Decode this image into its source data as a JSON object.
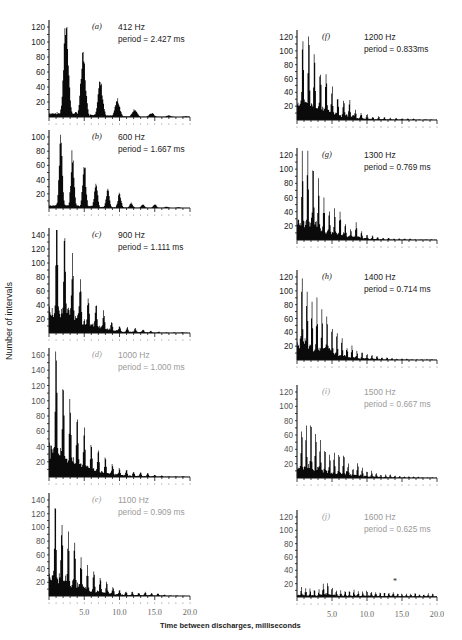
{
  "figure": {
    "ylabel": "Number of intervals",
    "xlabel": "Time between discharges, milliseconds",
    "xticks": [
      "5.0",
      "10.0",
      "15.0",
      "20.0"
    ]
  },
  "chart_data": [
    {
      "type": "bar",
      "panel": "(a)",
      "title": "412 Hz",
      "subtitle": "period = 2.427 ms",
      "xlabel": "Time between discharges, milliseconds",
      "ylabel": "Number of intervals",
      "xlim": [
        0,
        20
      ],
      "ylim": [
        0,
        120
      ],
      "yticks": [
        20,
        40,
        60,
        80,
        100,
        120
      ],
      "period_ms": 2.427,
      "peaks": [
        {
          "x": 2.43,
          "y": 122
        },
        {
          "x": 4.85,
          "y": 78
        },
        {
          "x": 7.28,
          "y": 45
        },
        {
          "x": 9.71,
          "y": 22
        },
        {
          "x": 12.14,
          "y": 10
        },
        {
          "x": 14.56,
          "y": 5
        },
        {
          "x": 16.99,
          "y": 2
        },
        {
          "x": 19.42,
          "y": 1
        }
      ],
      "column": "left",
      "box": {
        "top": 20,
        "base": 117
      }
    },
    {
      "type": "bar",
      "panel": "(b)",
      "title": "600 Hz",
      "subtitle": "period = 1.667 ms",
      "xlim": [
        0,
        20
      ],
      "ylim": [
        0,
        100
      ],
      "yticks": [
        20,
        40,
        60,
        80,
        100
      ],
      "period_ms": 1.667,
      "peaks": [
        {
          "x": 1.67,
          "y": 95
        },
        {
          "x": 3.33,
          "y": 75
        },
        {
          "x": 5.0,
          "y": 62
        },
        {
          "x": 6.67,
          "y": 37
        },
        {
          "x": 8.33,
          "y": 25
        },
        {
          "x": 10.0,
          "y": 20
        },
        {
          "x": 11.67,
          "y": 7
        },
        {
          "x": 13.33,
          "y": 5
        },
        {
          "x": 15.0,
          "y": 5
        },
        {
          "x": 16.67,
          "y": 2
        },
        {
          "x": 18.33,
          "y": 1
        }
      ],
      "column": "left",
      "box": {
        "top": 130,
        "base": 208
      }
    },
    {
      "type": "bar",
      "panel": "(c)",
      "title": "900 Hz",
      "subtitle": "period = 1.111 ms",
      "xlim": [
        0,
        20
      ],
      "ylim": [
        0,
        140
      ],
      "yticks": [
        20,
        40,
        60,
        80,
        100,
        120,
        140
      ],
      "period_ms": 1.111,
      "peaks": [
        {
          "x": 1.11,
          "y": 145
        },
        {
          "x": 2.22,
          "y": 145
        },
        {
          "x": 3.33,
          "y": 102
        },
        {
          "x": 4.44,
          "y": 75
        },
        {
          "x": 5.56,
          "y": 55
        },
        {
          "x": 6.67,
          "y": 42
        },
        {
          "x": 7.78,
          "y": 30
        },
        {
          "x": 8.89,
          "y": 17
        },
        {
          "x": 10.0,
          "y": 10
        },
        {
          "x": 11.11,
          "y": 8
        },
        {
          "x": 12.22,
          "y": 7
        },
        {
          "x": 13.33,
          "y": 5
        },
        {
          "x": 14.44,
          "y": 3
        },
        {
          "x": 15.56,
          "y": 2
        },
        {
          "x": 16.67,
          "y": 1
        },
        {
          "x": 17.78,
          "y": 1
        },
        {
          "x": 18.89,
          "y": 1
        }
      ],
      "column": "left",
      "box": {
        "top": 228,
        "base": 333
      }
    },
    {
      "type": "bar",
      "panel": "(d)",
      "title": "1000 Hz",
      "subtitle": "period = 1.000 ms",
      "xlim": [
        0,
        20
      ],
      "ylim": [
        0,
        180
      ],
      "yticks": [
        20,
        40,
        60,
        80,
        100,
        120,
        140,
        160
      ],
      "period_ms": 1.0,
      "peaks": [
        {
          "x": 1,
          "y": 175
        },
        {
          "x": 2,
          "y": 125
        },
        {
          "x": 3,
          "y": 100
        },
        {
          "x": 4,
          "y": 83
        },
        {
          "x": 5,
          "y": 62
        },
        {
          "x": 6,
          "y": 47
        },
        {
          "x": 7,
          "y": 33
        },
        {
          "x": 8,
          "y": 27
        },
        {
          "x": 9,
          "y": 17
        },
        {
          "x": 10,
          "y": 11
        },
        {
          "x": 11,
          "y": 9
        },
        {
          "x": 12,
          "y": 7
        },
        {
          "x": 13,
          "y": 6
        },
        {
          "x": 14,
          "y": 5
        },
        {
          "x": 15,
          "y": 3
        },
        {
          "x": 16,
          "y": 2
        },
        {
          "x": 17,
          "y": 1
        },
        {
          "x": 18,
          "y": 1
        },
        {
          "x": 19,
          "y": 1
        }
      ],
      "column": "left",
      "box": {
        "top": 348,
        "base": 477
      }
    },
    {
      "type": "bar",
      "panel": "(e)",
      "title": "1100 Hz",
      "subtitle": "period = 0.909 ms",
      "xlim": [
        0,
        20
      ],
      "ylim": [
        0,
        140
      ],
      "yticks": [
        20,
        40,
        60,
        80,
        100,
        120,
        140
      ],
      "period_ms": 0.909,
      "peaks": [
        {
          "x": 0.91,
          "y": 135
        },
        {
          "x": 1.82,
          "y": 120
        },
        {
          "x": 2.73,
          "y": 90
        },
        {
          "x": 3.64,
          "y": 86
        },
        {
          "x": 4.55,
          "y": 55
        },
        {
          "x": 5.45,
          "y": 40
        },
        {
          "x": 6.36,
          "y": 40
        },
        {
          "x": 7.27,
          "y": 28
        },
        {
          "x": 8.18,
          "y": 22
        },
        {
          "x": 9.09,
          "y": 14
        },
        {
          "x": 10.0,
          "y": 9
        },
        {
          "x": 10.91,
          "y": 7
        },
        {
          "x": 11.82,
          "y": 6
        },
        {
          "x": 12.73,
          "y": 5
        },
        {
          "x": 13.64,
          "y": 6
        },
        {
          "x": 14.55,
          "y": 4
        },
        {
          "x": 15.45,
          "y": 4
        },
        {
          "x": 16.36,
          "y": 2
        },
        {
          "x": 17.27,
          "y": 1
        },
        {
          "x": 18.18,
          "y": 1
        }
      ],
      "column": "left",
      "box": {
        "top": 493,
        "base": 596
      }
    },
    {
      "type": "bar",
      "panel": "(f)",
      "title": "1200 Hz",
      "subtitle": "period = 0.833ms",
      "xlim": [
        0,
        20
      ],
      "ylim": [
        0,
        120
      ],
      "yticks": [
        20,
        40,
        60,
        80,
        100,
        120
      ],
      "period_ms": 0.833,
      "peaks": [
        {
          "x": 0.83,
          "y": 122
        },
        {
          "x": 1.67,
          "y": 122
        },
        {
          "x": 2.5,
          "y": 98
        },
        {
          "x": 3.33,
          "y": 77
        },
        {
          "x": 4.17,
          "y": 71
        },
        {
          "x": 5.0,
          "y": 47
        },
        {
          "x": 5.83,
          "y": 33
        },
        {
          "x": 6.67,
          "y": 33
        },
        {
          "x": 7.5,
          "y": 28
        },
        {
          "x": 8.33,
          "y": 14
        },
        {
          "x": 9.17,
          "y": 10
        },
        {
          "x": 10.0,
          "y": 8
        },
        {
          "x": 10.83,
          "y": 5
        },
        {
          "x": 11.67,
          "y": 5
        },
        {
          "x": 12.5,
          "y": 4
        },
        {
          "x": 13.33,
          "y": 3
        },
        {
          "x": 14.17,
          "y": 3
        },
        {
          "x": 15.0,
          "y": 2
        },
        {
          "x": 15.83,
          "y": 2
        },
        {
          "x": 16.67,
          "y": 2
        },
        {
          "x": 17.5,
          "y": 1
        },
        {
          "x": 18.33,
          "y": 1
        },
        {
          "x": 19.17,
          "y": 1
        }
      ],
      "column": "right",
      "box": {
        "top": 30,
        "base": 120
      }
    },
    {
      "type": "bar",
      "panel": "(g)",
      "title": "1300 Hz",
      "subtitle": "period = 0.769 ms",
      "xlim": [
        0,
        20
      ],
      "ylim": [
        0,
        120
      ],
      "yticks": [
        20,
        40,
        60,
        80,
        100,
        120
      ],
      "period_ms": 0.769,
      "peaks": [
        {
          "x": 0.77,
          "y": 127
        },
        {
          "x": 1.54,
          "y": 127
        },
        {
          "x": 2.31,
          "y": 105
        },
        {
          "x": 3.08,
          "y": 82
        },
        {
          "x": 3.85,
          "y": 55
        },
        {
          "x": 4.62,
          "y": 48
        },
        {
          "x": 5.38,
          "y": 44
        },
        {
          "x": 6.15,
          "y": 43
        },
        {
          "x": 6.92,
          "y": 22
        },
        {
          "x": 7.69,
          "y": 16
        },
        {
          "x": 8.46,
          "y": 23
        },
        {
          "x": 9.23,
          "y": 12
        },
        {
          "x": 10.0,
          "y": 8
        },
        {
          "x": 10.77,
          "y": 6
        },
        {
          "x": 11.54,
          "y": 4
        },
        {
          "x": 12.31,
          "y": 3
        },
        {
          "x": 13.08,
          "y": 3
        },
        {
          "x": 13.85,
          "y": 2
        },
        {
          "x": 14.62,
          "y": 2
        },
        {
          "x": 15.38,
          "y": 2
        },
        {
          "x": 16.15,
          "y": 2
        },
        {
          "x": 16.92,
          "y": 1
        },
        {
          "x": 17.69,
          "y": 1
        },
        {
          "x": 18.46,
          "y": 1
        },
        {
          "x": 19.23,
          "y": 1
        }
      ],
      "column": "right",
      "box": {
        "top": 148,
        "base": 240
      }
    },
    {
      "type": "bar",
      "panel": "(h)",
      "title": "1400 Hz",
      "subtitle": "period = 0.714 ms",
      "xlim": [
        0,
        20
      ],
      "ylim": [
        0,
        120
      ],
      "yticks": [
        20,
        40,
        60,
        80,
        100,
        120
      ],
      "period_ms": 0.714,
      "peaks": [
        {
          "x": 0.71,
          "y": 125
        },
        {
          "x": 1.43,
          "y": 107
        },
        {
          "x": 2.14,
          "y": 88
        },
        {
          "x": 2.86,
          "y": 84
        },
        {
          "x": 3.57,
          "y": 77
        },
        {
          "x": 4.29,
          "y": 65
        },
        {
          "x": 5.0,
          "y": 48
        },
        {
          "x": 5.71,
          "y": 38
        },
        {
          "x": 6.43,
          "y": 33
        },
        {
          "x": 7.14,
          "y": 20
        },
        {
          "x": 7.86,
          "y": 20
        },
        {
          "x": 8.57,
          "y": 12
        },
        {
          "x": 9.29,
          "y": 11
        },
        {
          "x": 10.0,
          "y": 9
        },
        {
          "x": 10.71,
          "y": 8
        },
        {
          "x": 11.43,
          "y": 6
        },
        {
          "x": 12.14,
          "y": 4
        },
        {
          "x": 12.86,
          "y": 4
        },
        {
          "x": 13.57,
          "y": 3
        },
        {
          "x": 14.29,
          "y": 2
        },
        {
          "x": 15.0,
          "y": 2
        },
        {
          "x": 15.71,
          "y": 2
        },
        {
          "x": 16.43,
          "y": 1
        },
        {
          "x": 17.14,
          "y": 1
        },
        {
          "x": 17.86,
          "y": 1
        },
        {
          "x": 18.57,
          "y": 1
        },
        {
          "x": 19.29,
          "y": 1
        }
      ],
      "column": "right",
      "box": {
        "top": 270,
        "base": 360
      }
    },
    {
      "type": "bar",
      "panel": "(i)",
      "title": "1500 Hz",
      "subtitle": "period = 0.667 ms",
      "xlim": [
        0,
        20
      ],
      "ylim": [
        0,
        120
      ],
      "yticks": [
        20,
        40,
        60,
        80,
        100,
        120
      ],
      "period_ms": 0.667,
      "peaks": [
        {
          "x": 0.67,
          "y": 73
        },
        {
          "x": 1.33,
          "y": 67
        },
        {
          "x": 2.0,
          "y": 75
        },
        {
          "x": 2.67,
          "y": 66
        },
        {
          "x": 3.33,
          "y": 50
        },
        {
          "x": 4.0,
          "y": 45
        },
        {
          "x": 4.67,
          "y": 37
        },
        {
          "x": 5.33,
          "y": 34
        },
        {
          "x": 6.0,
          "y": 33
        },
        {
          "x": 6.67,
          "y": 37
        },
        {
          "x": 7.33,
          "y": 20
        },
        {
          "x": 8.0,
          "y": 15
        },
        {
          "x": 8.67,
          "y": 22
        },
        {
          "x": 9.33,
          "y": 13
        },
        {
          "x": 10.0,
          "y": 10
        },
        {
          "x": 10.67,
          "y": 10
        },
        {
          "x": 11.33,
          "y": 8
        },
        {
          "x": 12.0,
          "y": 5
        },
        {
          "x": 12.67,
          "y": 5
        },
        {
          "x": 13.33,
          "y": 5
        },
        {
          "x": 14.0,
          "y": 3
        },
        {
          "x": 14.67,
          "y": 3
        },
        {
          "x": 15.33,
          "y": 2
        },
        {
          "x": 16.0,
          "y": 2
        },
        {
          "x": 16.67,
          "y": 2
        },
        {
          "x": 17.33,
          "y": 2
        },
        {
          "x": 18.0,
          "y": 1
        },
        {
          "x": 18.67,
          "y": 1
        },
        {
          "x": 19.33,
          "y": 1
        }
      ],
      "column": "right",
      "box": {
        "top": 385,
        "base": 478
      }
    },
    {
      "type": "bar",
      "panel": "(j)",
      "title": "1600 Hz",
      "subtitle": "period = 0.625 ms",
      "xlim": [
        0,
        20
      ],
      "ylim": [
        0,
        120
      ],
      "yticks": [
        20,
        40,
        60,
        80,
        100,
        120
      ],
      "period_ms": 0.625,
      "annotation": "*",
      "annotation_x": 14.0,
      "annotation_y": 19,
      "peaks": [
        {
          "x": 0.63,
          "y": 15
        },
        {
          "x": 1.25,
          "y": 13
        },
        {
          "x": 1.88,
          "y": 12
        },
        {
          "x": 2.5,
          "y": 12
        },
        {
          "x": 3.13,
          "y": 11
        },
        {
          "x": 3.75,
          "y": 22
        },
        {
          "x": 4.38,
          "y": 20
        },
        {
          "x": 5.0,
          "y": 14
        },
        {
          "x": 5.63,
          "y": 10
        },
        {
          "x": 6.25,
          "y": 9
        },
        {
          "x": 6.88,
          "y": 10
        },
        {
          "x": 7.5,
          "y": 9
        },
        {
          "x": 8.13,
          "y": 10
        },
        {
          "x": 8.75,
          "y": 9
        },
        {
          "x": 9.38,
          "y": 8
        },
        {
          "x": 10.0,
          "y": 10
        },
        {
          "x": 10.63,
          "y": 8
        },
        {
          "x": 11.25,
          "y": 7
        },
        {
          "x": 11.88,
          "y": 7
        },
        {
          "x": 12.5,
          "y": 7
        },
        {
          "x": 13.13,
          "y": 7
        },
        {
          "x": 13.75,
          "y": 8
        },
        {
          "x": 14.38,
          "y": 6
        },
        {
          "x": 15.0,
          "y": 5
        },
        {
          "x": 15.63,
          "y": 5
        },
        {
          "x": 16.25,
          "y": 5
        },
        {
          "x": 16.88,
          "y": 6
        },
        {
          "x": 17.5,
          "y": 4
        },
        {
          "x": 18.13,
          "y": 4
        },
        {
          "x": 18.75,
          "y": 5
        },
        {
          "x": 19.38,
          "y": 5
        }
      ],
      "column": "right",
      "box": {
        "top": 510,
        "base": 597
      }
    }
  ],
  "layout": {
    "left_axis": {
      "x0": 49,
      "x1": 190
    },
    "right_axis": {
      "x0": 297,
      "x1": 437
    },
    "label_color": "#222222",
    "bar_color": "#0a0a0a",
    "faded_label_color": "#9a9a9a",
    "faded_panels": [
      "(d)",
      "(e)",
      "(i)",
      "(j)"
    ],
    "xtick_label_y": {
      "left": 615,
      "right": 617
    }
  }
}
